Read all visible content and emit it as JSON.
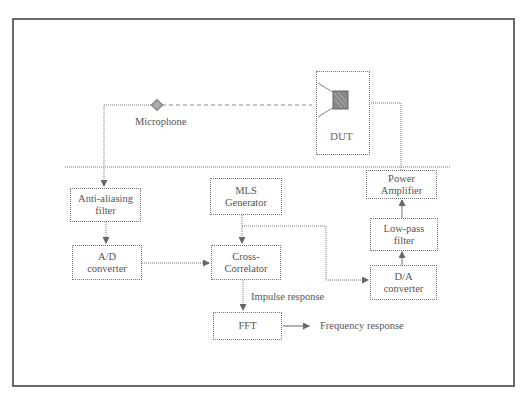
{
  "diagram": {
    "labels": {
      "microphone": "Microphone",
      "dut": "DUT",
      "impulse_response": "Impulse response",
      "frequency_response": "Frequency response"
    },
    "blocks": {
      "anti_aliasing": {
        "line1": "Anti-aliasing",
        "line2": "filter"
      },
      "ad_converter": {
        "line1": "A/D",
        "line2": "converter"
      },
      "mls_generator": {
        "line1": "MLS",
        "line2": "Generator"
      },
      "cross_correlator": {
        "line1": "Cross-",
        "line2": "Correlator"
      },
      "fft": {
        "line1": "FFT"
      },
      "power_amplifier": {
        "line1": "Power",
        "line2": "Amplifier"
      },
      "low_pass_filter": {
        "line1": "Low-pass",
        "line2": "filter"
      },
      "da_converter": {
        "line1": "D/A",
        "line2": "converter"
      }
    },
    "icons": {
      "microphone": "microphone-diamond-icon",
      "speaker": "loudspeaker-icon"
    },
    "colors": {
      "line": "#777777",
      "frame": "#6a6a6a",
      "text": "#555555"
    }
  }
}
